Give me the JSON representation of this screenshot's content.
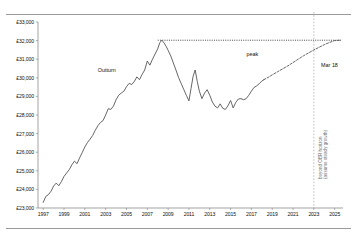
{
  "chart_data": {
    "type": "line",
    "title": "",
    "xlabel": "",
    "ylabel": "",
    "ylim": [
      23000,
      33000
    ],
    "xlim": [
      1996.5,
      2025.8
    ],
    "grid": false,
    "legend": "none",
    "ytick_labels": [
      "£33,000",
      "£32,000",
      "£31,000",
      "£30,000",
      "£29,000",
      "£28,000",
      "£27,000",
      "£26,000",
      "£25,000",
      "£24,000",
      "£23,000"
    ],
    "ytick_values": [
      33000,
      32000,
      31000,
      30000,
      29000,
      28000,
      27000,
      26000,
      25000,
      24000,
      23000
    ],
    "xtick_labels": [
      "1997",
      "1999",
      "2001",
      "2003",
      "2005",
      "2007",
      "2009",
      "2011",
      "2013",
      "2015",
      "2017",
      "2019",
      "2021",
      "2023",
      "2025"
    ],
    "xtick_values": [
      1997,
      1999,
      2001,
      2003,
      2005,
      2007,
      2009,
      2011,
      2013,
      2015,
      2017,
      2019,
      2021,
      2023,
      2025
    ],
    "annotations": [
      {
        "name": "outturn",
        "text": "Outturn",
        "x": 2003.2,
        "y": 30350
      },
      {
        "name": "peak",
        "text": "peak",
        "x": 2017.0,
        "y": 31550
      },
      {
        "name": "mar18",
        "text": "Mar 18",
        "x": 2023.6,
        "y": 30700
      },
      {
        "name": "beyond-obr",
        "text": "beyond OBR horizon",
        "x": 2023.0,
        "y": 26400
      },
      {
        "name": "steady-growth",
        "text": "(assume steady growth)",
        "x": 2023.0,
        "y": 26400
      }
    ],
    "peak_line": {
      "name": "peak-level",
      "value": 32020,
      "style": "dotted",
      "x_start": 2008.0,
      "x_end": 2025.7
    },
    "forecast_divider": {
      "name": "obr-horizon",
      "x": 2023.0,
      "style": "dashed",
      "color": "#b7b7b7"
    },
    "series": [
      {
        "name": "Outturn",
        "style": "solid",
        "color": "#4a4a4a",
        "points": [
          [
            1997.0,
            23300
          ],
          [
            1997.25,
            23620
          ],
          [
            1997.5,
            23720
          ],
          [
            1997.75,
            23900
          ],
          [
            1998.0,
            24180
          ],
          [
            1998.25,
            24340
          ],
          [
            1998.5,
            24200
          ],
          [
            1998.75,
            24420
          ],
          [
            1999.0,
            24700
          ],
          [
            1999.25,
            24880
          ],
          [
            1999.5,
            25060
          ],
          [
            1999.75,
            25320
          ],
          [
            2000.0,
            25520
          ],
          [
            2000.25,
            25380
          ],
          [
            2000.5,
            25700
          ],
          [
            2000.75,
            25980
          ],
          [
            2001.0,
            26280
          ],
          [
            2001.25,
            26520
          ],
          [
            2001.5,
            26700
          ],
          [
            2001.75,
            26900
          ],
          [
            2002.0,
            27180
          ],
          [
            2002.25,
            27420
          ],
          [
            2002.5,
            27600
          ],
          [
            2002.75,
            27700
          ],
          [
            2003.0,
            28000
          ],
          [
            2003.25,
            28340
          ],
          [
            2003.5,
            28300
          ],
          [
            2003.75,
            28480
          ],
          [
            2004.0,
            28820
          ],
          [
            2004.25,
            29060
          ],
          [
            2004.5,
            29180
          ],
          [
            2004.75,
            29280
          ],
          [
            2005.0,
            29520
          ],
          [
            2005.25,
            29700
          ],
          [
            2005.5,
            29640
          ],
          [
            2005.75,
            29800
          ],
          [
            2006.0,
            30050
          ],
          [
            2006.25,
            29900
          ],
          [
            2006.5,
            30180
          ],
          [
            2006.75,
            30420
          ],
          [
            2007.0,
            30900
          ],
          [
            2007.25,
            30680
          ],
          [
            2007.5,
            31000
          ],
          [
            2007.75,
            31280
          ],
          [
            2008.0,
            31560
          ],
          [
            2008.2,
            31880
          ],
          [
            2008.4,
            32020
          ],
          [
            2008.6,
            31880
          ],
          [
            2008.8,
            31700
          ],
          [
            2009.0,
            31480
          ],
          [
            2009.25,
            31180
          ],
          [
            2009.5,
            30800
          ],
          [
            2009.75,
            30420
          ],
          [
            2010.0,
            30020
          ],
          [
            2010.25,
            29700
          ],
          [
            2010.5,
            29380
          ],
          [
            2010.75,
            29060
          ],
          [
            2011.0,
            28760
          ],
          [
            2011.2,
            29420
          ],
          [
            2011.4,
            30080
          ],
          [
            2011.6,
            30420
          ],
          [
            2011.8,
            29800
          ],
          [
            2012.0,
            29280
          ],
          [
            2012.25,
            28880
          ],
          [
            2012.5,
            29180
          ],
          [
            2012.75,
            29360
          ],
          [
            2013.0,
            29060
          ],
          [
            2013.25,
            28700
          ],
          [
            2013.5,
            28480
          ],
          [
            2013.75,
            28380
          ],
          [
            2014.0,
            28600
          ],
          [
            2014.25,
            28360
          ],
          [
            2014.5,
            28300
          ],
          [
            2014.75,
            28500
          ],
          [
            2015.0,
            28780
          ],
          [
            2015.25,
            28380
          ],
          [
            2015.5,
            28680
          ],
          [
            2015.75,
            28860
          ],
          [
            2016.0,
            28880
          ],
          [
            2016.25,
            28820
          ],
          [
            2016.5,
            28880
          ],
          [
            2016.75,
            29060
          ],
          [
            2017.0,
            29280
          ],
          [
            2017.25,
            29480
          ],
          [
            2017.5,
            29560
          ],
          [
            2017.75,
            29680
          ],
          [
            2018.0,
            29820
          ],
          [
            2018.2,
            29900
          ]
        ]
      },
      {
        "name": "Forecast",
        "style": "dashed",
        "color": "#4a4a4a",
        "points": [
          [
            2018.2,
            29900
          ],
          [
            2018.6,
            30020
          ],
          [
            2019.0,
            30160
          ],
          [
            2019.5,
            30320
          ],
          [
            2020.0,
            30480
          ],
          [
            2020.5,
            30640
          ],
          [
            2021.0,
            30820
          ],
          [
            2021.5,
            31000
          ],
          [
            2022.0,
            31180
          ],
          [
            2022.5,
            31340
          ],
          [
            2023.0,
            31500
          ],
          [
            2023.5,
            31640
          ],
          [
            2024.0,
            31780
          ],
          [
            2024.5,
            31900
          ],
          [
            2025.0,
            32000
          ],
          [
            2025.5,
            32020
          ]
        ]
      }
    ]
  }
}
